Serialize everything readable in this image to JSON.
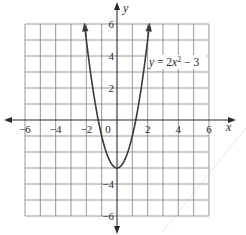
{
  "chart_data": {
    "type": "line",
    "title": "",
    "equation_label": "y = 2x² − 3",
    "equation_parts": {
      "prefix": "y = 2",
      "var": "x",
      "exp": "2",
      "suffix": " − 3"
    },
    "xlabel": "x",
    "ylabel": "y",
    "xlim": [
      -6,
      6
    ],
    "ylim": [
      -6,
      6
    ],
    "grid": true,
    "grid_step": 1,
    "x_ticks": [
      -6,
      -4,
      -2,
      0,
      2,
      4,
      6
    ],
    "x_tick_labels": [
      "−6",
      "−4",
      "−2",
      "0",
      "2",
      "4",
      "6"
    ],
    "y_ticks": [
      6,
      4,
      2,
      -4,
      -6
    ],
    "y_tick_labels": [
      "6",
      "4",
      "2",
      "−4",
      "−6"
    ],
    "series": [
      {
        "name": "y = 2x² − 3",
        "function": "2*x^2 - 3",
        "x": [
          -2.121,
          -2,
          -1.5,
          -1,
          -0.5,
          0,
          0.5,
          1,
          1.5,
          2,
          2.121
        ],
        "y": [
          6,
          5,
          1.5,
          -1,
          -2.5,
          -3,
          -2.5,
          -1,
          1.5,
          5,
          6
        ],
        "arrows_at_ends": true
      }
    ],
    "vertex": [
      0,
      -3
    ],
    "legend": "none"
  },
  "colors": {
    "grid": "#8a8a8a",
    "axis": "#2a2a2a",
    "curve": "#3a3a3a",
    "background": "#ffffff"
  }
}
